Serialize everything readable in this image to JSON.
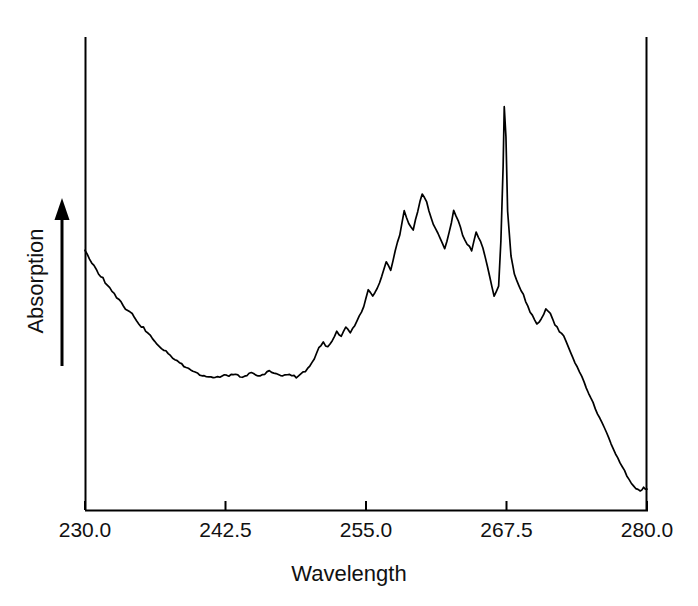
{
  "chart_data": {
    "type": "line",
    "title": "",
    "xlabel": "Wavelength",
    "ylabel": "Absorption",
    "xlim": [
      230.0,
      280.0
    ],
    "xticks": [
      230.0,
      242.5,
      255.0,
      267.5,
      280.0
    ],
    "xtick_labels": [
      "230.0",
      "242.5",
      "255.0",
      "267.5",
      "280.0"
    ],
    "ylim": [
      0,
      1
    ],
    "yticks": [],
    "ytick_labels": [],
    "grid": false,
    "legend": null,
    "y_axis_arrow": "upward",
    "line_color": "#000000",
    "background_color": "#ffffff",
    "axis_color": "#000000",
    "series": [
      {
        "name": "absorption-spectrum",
        "x": [
          230.0,
          230.4,
          230.8,
          231.2,
          231.6,
          232.0,
          232.4,
          232.8,
          233.2,
          233.6,
          234.0,
          234.4,
          234.8,
          235.2,
          235.6,
          236.0,
          236.4,
          236.8,
          237.2,
          237.6,
          238.0,
          238.4,
          238.8,
          239.2,
          239.6,
          240.0,
          240.4,
          240.8,
          241.2,
          241.6,
          242.0,
          242.4,
          242.8,
          243.2,
          243.6,
          244.0,
          244.4,
          244.8,
          245.2,
          245.6,
          246.0,
          246.4,
          246.8,
          247.2,
          247.6,
          248.0,
          248.4,
          248.8,
          249.2,
          249.6,
          250.0,
          250.4,
          250.8,
          251.2,
          251.6,
          252.0,
          252.4,
          252.8,
          253.2,
          253.6,
          254.0,
          254.4,
          254.8,
          255.2,
          255.6,
          256.0,
          256.4,
          256.8,
          257.2,
          257.6,
          258.0,
          258.4,
          258.8,
          259.2,
          259.6,
          260.0,
          260.4,
          260.8,
          261.2,
          261.6,
          262.0,
          262.4,
          262.8,
          263.2,
          263.6,
          264.0,
          264.4,
          264.8,
          265.2,
          265.6,
          266.0,
          266.4,
          266.8,
          267.0,
          267.2,
          267.3,
          267.45,
          267.6,
          267.9,
          268.2,
          268.6,
          269.0,
          269.4,
          269.8,
          270.2,
          270.6,
          271.0,
          271.4,
          271.8,
          272.2,
          272.6,
          273.0,
          273.4,
          273.8,
          274.2,
          274.6,
          275.0,
          275.4,
          275.8,
          276.2,
          276.6,
          277.0,
          277.4,
          277.8,
          278.2,
          278.6,
          279.0,
          279.4,
          279.7,
          280.0
        ],
        "y": [
          0.648,
          0.636,
          0.628,
          0.617,
          0.61,
          0.6,
          0.594,
          0.584,
          0.578,
          0.57,
          0.566,
          0.558,
          0.548,
          0.544,
          0.536,
          0.53,
          0.523,
          0.517,
          0.512,
          0.506,
          0.501,
          0.498,
          0.493,
          0.489,
          0.486,
          0.483,
          0.48,
          0.479,
          0.478,
          0.477,
          0.478,
          0.481,
          0.479,
          0.482,
          0.48,
          0.478,
          0.481,
          0.484,
          0.481,
          0.479,
          0.482,
          0.486,
          0.484,
          0.481,
          0.479,
          0.482,
          0.48,
          0.478,
          0.482,
          0.486,
          0.492,
          0.503,
          0.516,
          0.524,
          0.518,
          0.527,
          0.54,
          0.532,
          0.545,
          0.538,
          0.548,
          0.56,
          0.572,
          0.596,
          0.586,
          0.598,
          0.612,
          0.632,
          0.62,
          0.648,
          0.668,
          0.7,
          0.684,
          0.676,
          0.7,
          0.724,
          0.712,
          0.69,
          0.676,
          0.664,
          0.65,
          0.672,
          0.7,
          0.688,
          0.668,
          0.656,
          0.648,
          0.672,
          0.66,
          0.64,
          0.612,
          0.586,
          0.6,
          0.66,
          0.76,
          0.84,
          0.8,
          0.7,
          0.64,
          0.616,
          0.6,
          0.588,
          0.572,
          0.56,
          0.548,
          0.556,
          0.568,
          0.562,
          0.548,
          0.54,
          0.532,
          0.518,
          0.504,
          0.492,
          0.478,
          0.464,
          0.45,
          0.436,
          0.422,
          0.41,
          0.396,
          0.382,
          0.37,
          0.358,
          0.346,
          0.336,
          0.33,
          0.326,
          0.33,
          0.328
        ]
      }
    ]
  },
  "axis": {
    "x_tick_labels": [
      "230.0",
      "242.5",
      "255.0",
      "267.5",
      "280.0"
    ],
    "x_axis_title": "Wavelength",
    "y_axis_title": "Absorption"
  }
}
